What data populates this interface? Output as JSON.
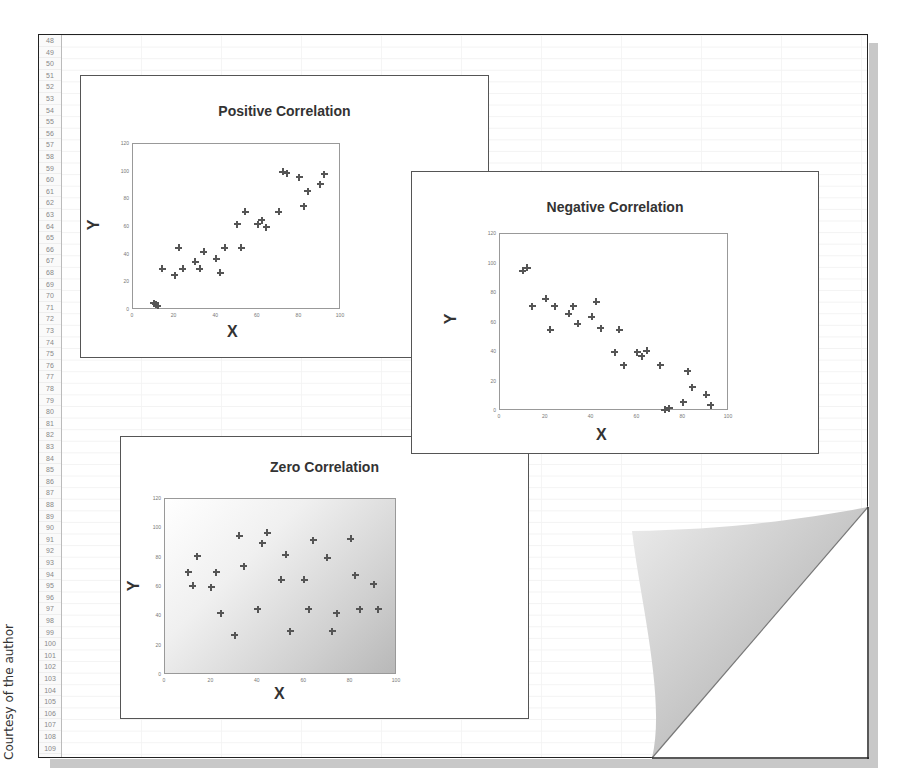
{
  "credit": "Courtesy of the author",
  "row_headers": [
    "48",
    "49",
    "50",
    "51",
    "52",
    "53",
    "54",
    "55",
    "56",
    "57",
    "58",
    "59",
    "60",
    "61",
    "62",
    "63",
    "64",
    "65",
    "66",
    "67",
    "68",
    "69",
    "70",
    "71",
    "72",
    "73",
    "74",
    "75",
    "76",
    "77",
    "78",
    "79",
    "80",
    "81",
    "82",
    "83",
    "84",
    "85",
    "86",
    "87",
    "88",
    "89",
    "90",
    "91",
    "92",
    "93",
    "94",
    "95",
    "96",
    "97",
    "98",
    "99",
    "100",
    "101",
    "102",
    "103",
    "104",
    "105",
    "106",
    "107",
    "108",
    "109"
  ],
  "charts": {
    "positive": {
      "title": "Positive Correlation",
      "xlabel": "X",
      "ylabel": "Y"
    },
    "negative": {
      "title": "Negative Correlation",
      "xlabel": "X",
      "ylabel": "Y"
    },
    "zero": {
      "title": "Zero Correlation",
      "xlabel": "X",
      "ylabel": "Y"
    }
  },
  "chart_data": [
    {
      "type": "scatter",
      "title": "Positive Correlation",
      "xlabel": "X",
      "ylabel": "Y",
      "xlim": [
        0,
        100
      ],
      "ylim": [
        0,
        120
      ],
      "xticks": [
        0,
        20,
        40,
        60,
        80,
        100
      ],
      "yticks": [
        0,
        20,
        40,
        60,
        80,
        100,
        120
      ],
      "grid": false,
      "legend": null,
      "points": [
        [
          10,
          5
        ],
        [
          11,
          4
        ],
        [
          12,
          3
        ],
        [
          14,
          30
        ],
        [
          20,
          25
        ],
        [
          22,
          45
        ],
        [
          24,
          30
        ],
        [
          30,
          35
        ],
        [
          32,
          30
        ],
        [
          34,
          42
        ],
        [
          40,
          37
        ],
        [
          42,
          27
        ],
        [
          44,
          45
        ],
        [
          50,
          62
        ],
        [
          52,
          45
        ],
        [
          54,
          71
        ],
        [
          60,
          62
        ],
        [
          62,
          65
        ],
        [
          64,
          60
        ],
        [
          70,
          71
        ],
        [
          72,
          100
        ],
        [
          74,
          99
        ],
        [
          80,
          96
        ],
        [
          82,
          75
        ],
        [
          84,
          86
        ],
        [
          90,
          91
        ],
        [
          92,
          98
        ]
      ]
    },
    {
      "type": "scatter",
      "title": "Negative Correlation",
      "xlabel": "X",
      "ylabel": "Y",
      "xlim": [
        0,
        100
      ],
      "ylim": [
        0,
        120
      ],
      "xticks": [
        0,
        20,
        40,
        60,
        80,
        100
      ],
      "yticks": [
        0,
        20,
        40,
        60,
        80,
        100,
        120
      ],
      "grid": false,
      "legend": null,
      "points": [
        [
          10,
          95
        ],
        [
          12,
          97
        ],
        [
          14,
          71
        ],
        [
          20,
          76
        ],
        [
          22,
          55
        ],
        [
          24,
          71
        ],
        [
          30,
          66
        ],
        [
          32,
          71
        ],
        [
          34,
          59
        ],
        [
          40,
          64
        ],
        [
          42,
          74
        ],
        [
          44,
          56
        ],
        [
          50,
          40
        ],
        [
          52,
          55
        ],
        [
          54,
          31
        ],
        [
          60,
          40
        ],
        [
          62,
          37
        ],
        [
          64,
          41
        ],
        [
          70,
          31
        ],
        [
          72,
          1
        ],
        [
          74,
          2
        ],
        [
          80,
          6
        ],
        [
          82,
          27
        ],
        [
          84,
          16
        ],
        [
          90,
          11
        ],
        [
          92,
          4
        ]
      ]
    },
    {
      "type": "scatter",
      "title": "Zero Correlation",
      "xlabel": "X",
      "ylabel": "Y",
      "xlim": [
        0,
        100
      ],
      "ylim": [
        0,
        120
      ],
      "xticks": [
        0,
        20,
        40,
        60,
        80,
        100
      ],
      "yticks": [
        0,
        20,
        40,
        60,
        80,
        100,
        120
      ],
      "grid": false,
      "legend": null,
      "background": "gradient white-to-gray",
      "points": [
        [
          10,
          70
        ],
        [
          12,
          61
        ],
        [
          14,
          81
        ],
        [
          20,
          60
        ],
        [
          22,
          70
        ],
        [
          24,
          42
        ],
        [
          30,
          27
        ],
        [
          32,
          95
        ],
        [
          34,
          74
        ],
        [
          40,
          45
        ],
        [
          42,
          90
        ],
        [
          44,
          97
        ],
        [
          50,
          65
        ],
        [
          52,
          82
        ],
        [
          54,
          30
        ],
        [
          60,
          65
        ],
        [
          62,
          45
        ],
        [
          64,
          92
        ],
        [
          70,
          80
        ],
        [
          72,
          30
        ],
        [
          74,
          42
        ],
        [
          80,
          93
        ],
        [
          82,
          68
        ],
        [
          84,
          45
        ],
        [
          90,
          62
        ],
        [
          92,
          45
        ]
      ]
    }
  ]
}
